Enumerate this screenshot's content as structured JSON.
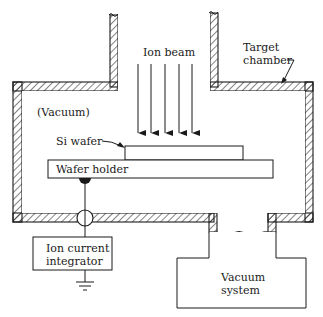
{
  "diagram": {
    "labels": {
      "ion_beam": "Ion beam",
      "target_chamber_line1": "Target",
      "target_chamber_line2": "chamber",
      "vacuum": "(Vacuum)",
      "si_wafer": "Si wafer",
      "wafer_holder": "Wafer holder",
      "ion_current_integrator_line1": "Ion current",
      "ion_current_integrator_line2": "integrator",
      "vacuum_system_line1": "Vacuum",
      "vacuum_system_line2": "system"
    },
    "ion_beam_arrow_count": 5,
    "colors": {
      "line": "#1a1a1a",
      "background": "#ffffff"
    }
  }
}
